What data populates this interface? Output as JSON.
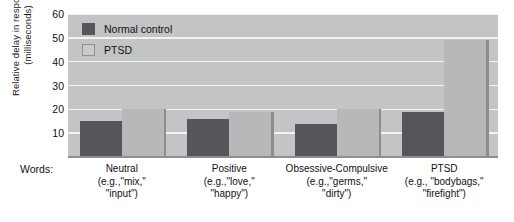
{
  "chart_data": {
    "type": "bar",
    "title": "",
    "xlabel": "Words:",
    "ylabel_line1": "Relative delay in responding",
    "ylabel_line2": "(milliseconds)",
    "ylim": [
      0,
      60
    ],
    "yticks": [
      10,
      20,
      30,
      40,
      50,
      60
    ],
    "grid": true,
    "legend_position": "top-left",
    "categories": [
      "Neutral",
      "Positive",
      "Obsessive-Compulsive",
      "PTSD"
    ],
    "category_examples": [
      {
        "line1": "(e.g.,\"mix,\"",
        "line2": "\"input\")"
      },
      {
        "line1": "(e.g.,\"love,\"",
        "line2": "\"happy\")"
      },
      {
        "line1": "(e.g.,\"germs,\"",
        "line2": "\"dirty\")"
      },
      {
        "line1": "(e.g., \"bodybags,\"",
        "line2": "\"firefight\")"
      }
    ],
    "series": [
      {
        "name": "Normal control",
        "color": "#55565a",
        "values": [
          15,
          16,
          14,
          19
        ]
      },
      {
        "name": "PTSD",
        "color": "#b7b8ba",
        "values": [
          20,
          19,
          20,
          49
        ]
      }
    ]
  },
  "colors": {
    "plot_background": "#c3c4c5",
    "gridline": "#f2f2f2",
    "axis": "#8e8f90",
    "text": "#111111"
  }
}
